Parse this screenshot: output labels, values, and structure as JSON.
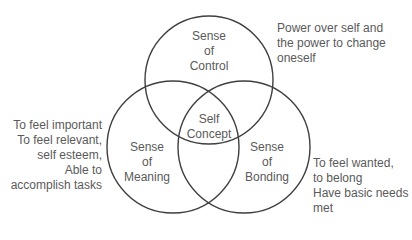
{
  "diagram": {
    "type": "venn-3",
    "colors": {
      "stroke": "#3f3f3f",
      "text": "#5a5a5a",
      "background": "#ffffff"
    },
    "circles": [
      {
        "id": "control",
        "cx": 209,
        "cy": 80,
        "r": 64,
        "label_lines": [
          "Sense",
          "of",
          "Control"
        ]
      },
      {
        "id": "meaning",
        "cx": 173,
        "cy": 147,
        "r": 66,
        "label_lines": [
          "Sense",
          "of",
          "Meaning"
        ]
      },
      {
        "id": "bonding",
        "cx": 244,
        "cy": 147,
        "r": 66,
        "label_lines": [
          "Sense",
          "of",
          "Bonding"
        ]
      }
    ],
    "center": {
      "label_lines": [
        "Self",
        "Concept"
      ]
    },
    "annotations": {
      "control": [
        "Power over self and",
        "the power to change",
        "oneself"
      ],
      "meaning": [
        "To feel important",
        "To feel relevant,",
        "self esteem,",
        "Able to",
        "accomplish tasks"
      ],
      "bonding": [
        "To feel wanted,",
        "to belong",
        "Have basic needs",
        "met"
      ]
    }
  }
}
